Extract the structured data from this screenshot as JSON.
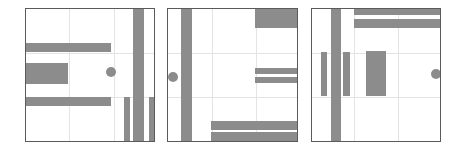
{
  "style": {
    "shape_color": "#8c8c8c",
    "border_color": "#5a5a5a",
    "grid_color": "#e4e4e4",
    "background": "#ffffff"
  },
  "panels": [
    {
      "name": "panel-1",
      "box": {
        "x": 25,
        "y": 8,
        "w": 130,
        "h": 134
      },
      "grid": {
        "v": [
          43,
          88
        ],
        "h": [
          44,
          88
        ]
      },
      "rects": [
        {
          "x": 0,
          "y": 35,
          "w": 86,
          "h": 9
        },
        {
          "x": 0,
          "y": 55,
          "w": 43,
          "h": 21
        },
        {
          "x": 0,
          "y": 89,
          "w": 86,
          "h": 9
        },
        {
          "x": 108,
          "y": 0,
          "w": 11,
          "h": 134
        },
        {
          "x": 99,
          "y": 89,
          "w": 6,
          "h": 45
        },
        {
          "x": 124,
          "y": 89,
          "w": 6,
          "h": 45
        }
      ],
      "circles": [
        {
          "cx": 86,
          "cy": 64,
          "r": 5
        }
      ]
    },
    {
      "name": "panel-2",
      "box": {
        "x": 167,
        "y": 8,
        "w": 131,
        "h": 134
      },
      "grid": {
        "v": [
          44,
          88
        ],
        "h": [
          44,
          88
        ]
      },
      "rects": [
        {
          "x": 14,
          "y": 0,
          "w": 11,
          "h": 134
        },
        {
          "x": 88,
          "y": 0,
          "w": 43,
          "h": 20
        },
        {
          "x": 88,
          "y": 60,
          "w": 43,
          "h": 6
        },
        {
          "x": 88,
          "y": 69,
          "w": 43,
          "h": 6
        },
        {
          "x": 44,
          "y": 113,
          "w": 87,
          "h": 9
        },
        {
          "x": 44,
          "y": 124,
          "w": 87,
          "h": 10
        }
      ],
      "circles": [
        {
          "cx": 6,
          "cy": 69,
          "r": 5
        }
      ]
    },
    {
      "name": "panel-3",
      "box": {
        "x": 311,
        "y": 8,
        "w": 130,
        "h": 134
      },
      "grid": {
        "v": [
          42,
          86
        ],
        "h": [
          44,
          88
        ]
      },
      "rects": [
        {
          "x": 20,
          "y": 0,
          "w": 10,
          "h": 134
        },
        {
          "x": 10,
          "y": 44,
          "w": 6,
          "h": 44
        },
        {
          "x": 32,
          "y": 44,
          "w": 7,
          "h": 44
        },
        {
          "x": 55,
          "y": 43,
          "w": 20,
          "h": 45
        },
        {
          "x": 43,
          "y": 0,
          "w": 87,
          "h": 7
        },
        {
          "x": 43,
          "y": 11,
          "w": 87,
          "h": 9
        }
      ],
      "circles": [
        {
          "cx": 125,
          "cy": 66,
          "r": 5
        }
      ]
    }
  ]
}
